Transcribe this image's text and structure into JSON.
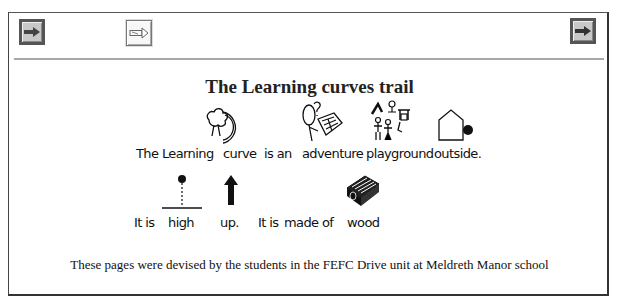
{
  "toolbar": {
    "buttons": [
      {
        "name": "forward-arrow-button-left",
        "icon": "arrow-right-icon",
        "style": "dark"
      },
      {
        "name": "text-arrow-button",
        "icon": "text-arrow-right-icon",
        "style": "light"
      },
      {
        "name": "forward-arrow-button-right",
        "icon": "arrow-right-icon",
        "style": "dark"
      }
    ]
  },
  "page": {
    "title": "The Learning curves trail",
    "sentence1": {
      "words": [
        "The Learning",
        "curve",
        "is an",
        "adventure",
        "playground",
        "outside."
      ],
      "symbols": [
        "tree-curve-symbol",
        "adventure-symbol",
        "playground-symbol",
        "outside-house-symbol"
      ]
    },
    "sentence2": {
      "words": [
        "It is",
        "high",
        "up.",
        "It is",
        "made of",
        "wood"
      ],
      "symbols": [
        "high-symbol",
        "up-arrow-symbol",
        "wood-symbol"
      ]
    },
    "footer": "These pages were devised by the students in the FEFC Drive unit at Meldreth Manor school"
  },
  "colors": {
    "frame_border": "#333333",
    "button_dark_border": "#555555",
    "button_fill": "#c8c8c8",
    "separator": "#a8a8a8",
    "arrow": "#444444"
  }
}
